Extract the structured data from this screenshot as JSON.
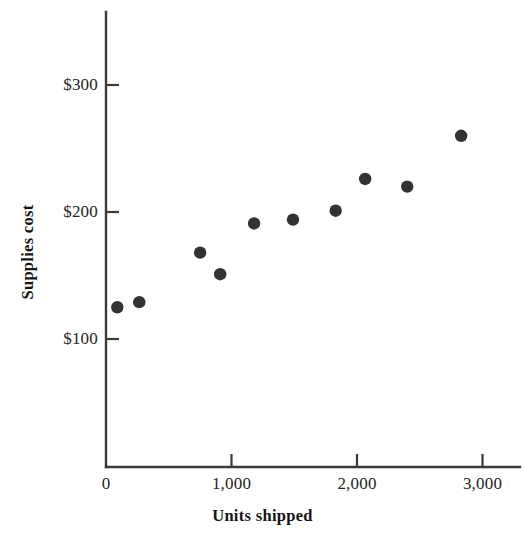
{
  "chart_data": {
    "type": "scatter",
    "title": "",
    "xlabel": "Units shipped",
    "ylabel": "Supplies cost",
    "xlim": [
      0,
      3300
    ],
    "ylim": [
      0,
      330
    ],
    "grid": false,
    "legend": "none",
    "x_ticks": [
      {
        "value": 0,
        "label": "0"
      },
      {
        "value": 1000,
        "label": "1,000"
      },
      {
        "value": 2000,
        "label": "2,000"
      },
      {
        "value": 3000,
        "label": "3,000"
      }
    ],
    "y_ticks": [
      {
        "value": 100,
        "label": "$100"
      },
      {
        "value": 200,
        "label": "$200"
      },
      {
        "value": 300,
        "label": "$300"
      }
    ],
    "series": [
      {
        "name": "Supplies cost vs units shipped",
        "marker": "filled-circle",
        "color": "#333333",
        "points": [
          {
            "x": 90,
            "y": 125
          },
          {
            "x": 265,
            "y": 129
          },
          {
            "x": 750,
            "y": 168
          },
          {
            "x": 910,
            "y": 151
          },
          {
            "x": 1180,
            "y": 191
          },
          {
            "x": 1490,
            "y": 194
          },
          {
            "x": 1830,
            "y": 201
          },
          {
            "x": 2065,
            "y": 226
          },
          {
            "x": 2400,
            "y": 220
          },
          {
            "x": 2830,
            "y": 260
          }
        ]
      }
    ]
  },
  "axes": {
    "x_title": "Units shipped",
    "y_title": "Supplies cost"
  },
  "colors": {
    "marker": "#333333",
    "axis": "#3a3a3a",
    "text": "#1a1a1a",
    "background": "#ffffff"
  }
}
